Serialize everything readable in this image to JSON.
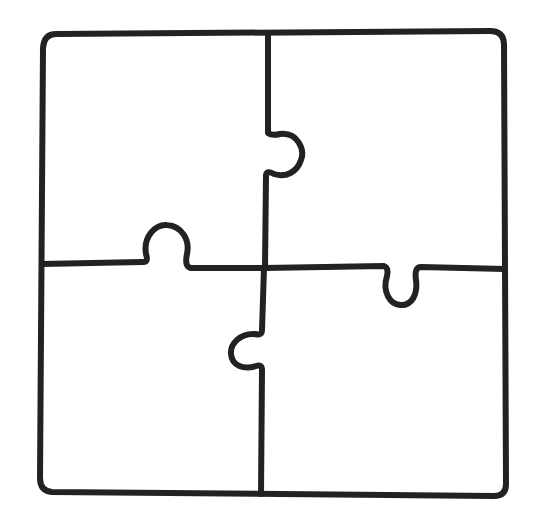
{
  "diagram": {
    "type": "jigsaw-puzzle-outline",
    "grid": {
      "rows": 2,
      "cols": 2
    },
    "stroke_color": "#222222",
    "background_color": "#ffffff",
    "stroke_width": 6,
    "pieces": [
      {
        "position": "top-left"
      },
      {
        "position": "top-right"
      },
      {
        "position": "bottom-left"
      },
      {
        "position": "bottom-right"
      }
    ],
    "knobs": [
      {
        "edge": "vertical-top",
        "direction": "right"
      },
      {
        "edge": "horizontal-left",
        "direction": "up"
      },
      {
        "edge": "horizontal-right",
        "direction": "down"
      },
      {
        "edge": "vertical-bottom",
        "direction": "left"
      }
    ]
  }
}
